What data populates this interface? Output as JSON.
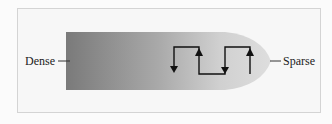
{
  "diagram": {
    "left_label": "Dense",
    "right_label": "Sparse",
    "shape": "tapered gradient bar (dark gray on left fading to light gray rounded tip on right)",
    "arrows": [
      "down",
      "up",
      "down",
      "up"
    ],
    "colors": {
      "dense": "#7a7a7a",
      "sparse": "#d9d9d9",
      "line": "#111111",
      "frame_border": "#d4d4d4"
    }
  }
}
